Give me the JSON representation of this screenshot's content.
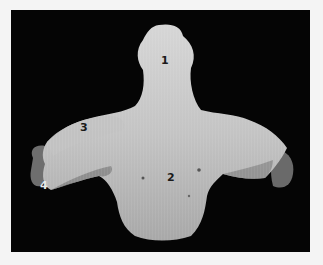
{
  "figure": {
    "labels": [
      {
        "id": "1",
        "text": "1",
        "x": 165,
        "y": 61,
        "tone": "dark"
      },
      {
        "id": "2",
        "text": "2",
        "x": 167,
        "y": 173,
        "tone": "dark"
      },
      {
        "id": "3",
        "text": "3",
        "x": 80,
        "y": 122,
        "tone": "dark"
      },
      {
        "id": "4",
        "text": "4",
        "x": 40,
        "y": 181,
        "tone": "light"
      }
    ],
    "colors": {
      "background": "#050505",
      "bone_light": "#d8d8d8",
      "bone_mid": "#b5b5b5",
      "bone_dark": "#7a7a7a",
      "page": "#f4f4f4"
    }
  }
}
